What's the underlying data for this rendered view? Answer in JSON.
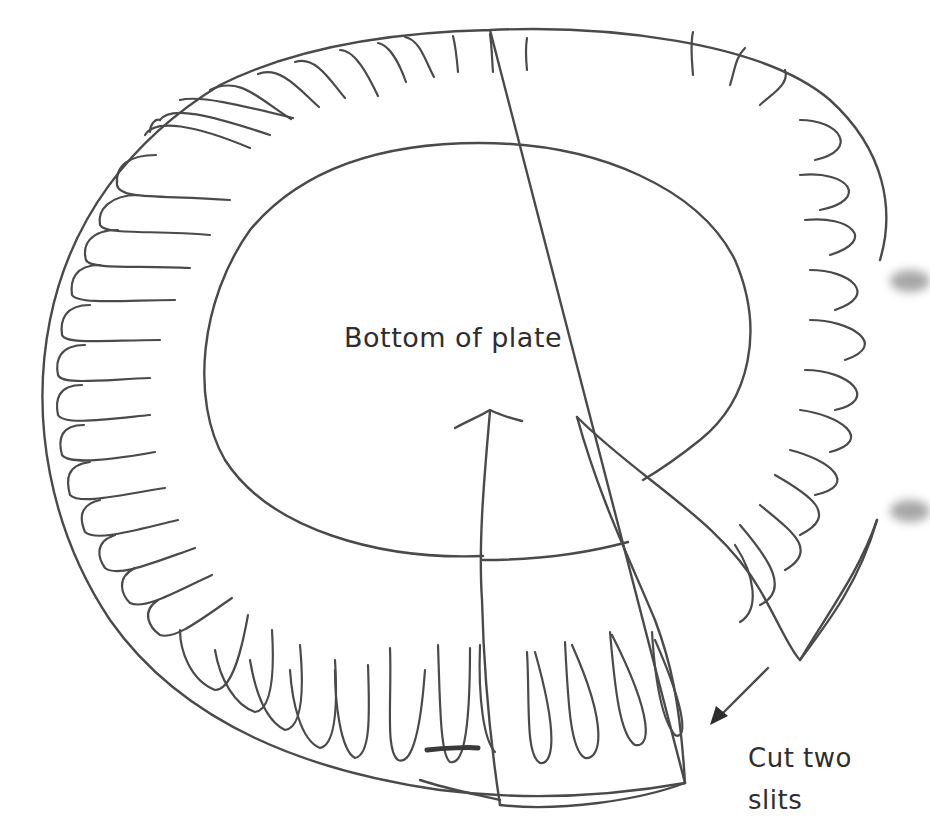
{
  "diagram": {
    "labels": {
      "bottom_of_plate": "Bottom of plate",
      "cut_line1": "Cut two",
      "cut_line2": "slits"
    },
    "colors": {
      "line": "#4a4a4a",
      "text": "#2e2e2e",
      "background": "#ffffff"
    },
    "annotations": {
      "arrow": "points to slit cut edge",
      "flap": "cut wedge folded back"
    }
  }
}
